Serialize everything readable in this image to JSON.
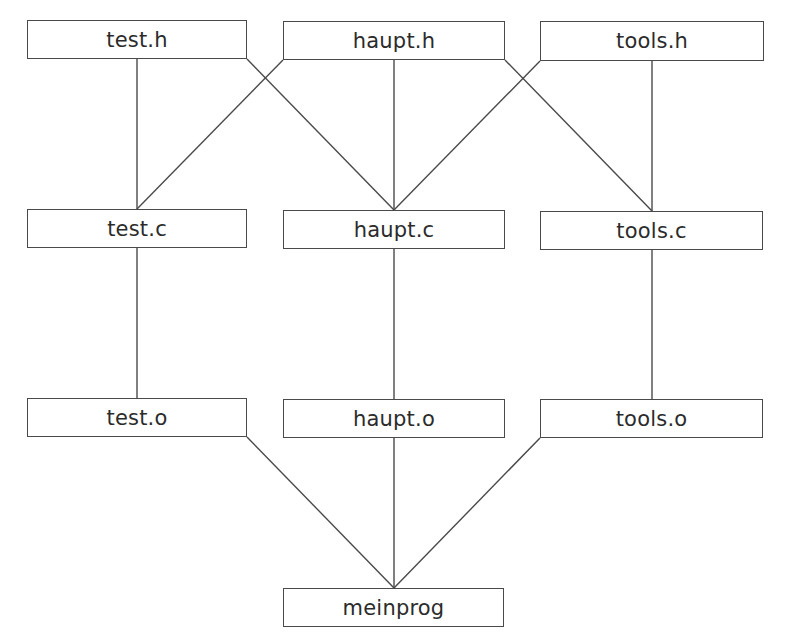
{
  "diagram": {
    "type": "dependency-graph",
    "line_color": "#4a4a4a",
    "background": "#ffffff",
    "nodes": [
      {
        "id": "test_h",
        "label": "test.h",
        "row": "headers",
        "x": 27,
        "y": 20,
        "w": 220,
        "h": 39
      },
      {
        "id": "haupt_h",
        "label": "haupt.h",
        "row": "headers",
        "x": 283,
        "y": 21,
        "w": 222,
        "h": 39
      },
      {
        "id": "tools_h",
        "label": "tools.h",
        "row": "headers",
        "x": 540,
        "y": 21,
        "w": 224,
        "h": 40
      },
      {
        "id": "test_c",
        "label": "test.c",
        "row": "sources",
        "x": 27,
        "y": 209,
        "w": 220,
        "h": 39
      },
      {
        "id": "haupt_c",
        "label": "haupt.c",
        "row": "sources",
        "x": 283,
        "y": 210,
        "w": 222,
        "h": 39
      },
      {
        "id": "tools_c",
        "label": "tools.c",
        "row": "sources",
        "x": 540,
        "y": 211,
        "w": 223,
        "h": 39
      },
      {
        "id": "test_o",
        "label": "test.o",
        "row": "objects",
        "x": 27,
        "y": 398,
        "w": 220,
        "h": 39
      },
      {
        "id": "haupt_o",
        "label": "haupt.o",
        "row": "objects",
        "x": 283,
        "y": 399,
        "w": 222,
        "h": 39
      },
      {
        "id": "tools_o",
        "label": "tools.o",
        "row": "objects",
        "x": 540,
        "y": 399,
        "w": 223,
        "h": 39
      },
      {
        "id": "meinprog",
        "label": "meinprog",
        "row": "program",
        "x": 283,
        "y": 588,
        "w": 221,
        "h": 39
      }
    ],
    "edges": [
      {
        "from": "test_h",
        "to": "test_c",
        "x1": 137,
        "y1": 59,
        "x2": 137,
        "y2": 209
      },
      {
        "from": "test_h",
        "to": "haupt_c",
        "x1": 247,
        "y1": 59,
        "x2": 394,
        "y2": 210
      },
      {
        "from": "haupt_h",
        "to": "test_c",
        "x1": 283,
        "y1": 60,
        "x2": 137,
        "y2": 209
      },
      {
        "from": "haupt_h",
        "to": "haupt_c",
        "x1": 394,
        "y1": 60,
        "x2": 394,
        "y2": 210
      },
      {
        "from": "haupt_h",
        "to": "tools_c",
        "x1": 505,
        "y1": 60,
        "x2": 652,
        "y2": 211
      },
      {
        "from": "tools_h",
        "to": "haupt_c",
        "x1": 540,
        "y1": 61,
        "x2": 394,
        "y2": 210
      },
      {
        "from": "tools_h",
        "to": "tools_c",
        "x1": 652,
        "y1": 61,
        "x2": 652,
        "y2": 211
      },
      {
        "from": "test_c",
        "to": "test_o",
        "x1": 137,
        "y1": 248,
        "x2": 137,
        "y2": 398
      },
      {
        "from": "haupt_c",
        "to": "haupt_o",
        "x1": 394,
        "y1": 249,
        "x2": 394,
        "y2": 399
      },
      {
        "from": "tools_c",
        "to": "tools_o",
        "x1": 652,
        "y1": 250,
        "x2": 652,
        "y2": 399
      },
      {
        "from": "test_o",
        "to": "meinprog",
        "x1": 247,
        "y1": 437,
        "x2": 394,
        "y2": 588
      },
      {
        "from": "haupt_o",
        "to": "meinprog",
        "x1": 394,
        "y1": 438,
        "x2": 394,
        "y2": 588
      },
      {
        "from": "tools_o",
        "to": "meinprog",
        "x1": 540,
        "y1": 438,
        "x2": 394,
        "y2": 588
      }
    ]
  }
}
